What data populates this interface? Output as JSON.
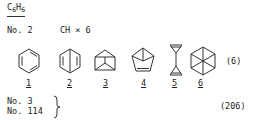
{
  "header": {
    "formula_base": "C",
    "formula_c_sub": "6",
    "formula_h": "H",
    "formula_h_sub": "6"
  },
  "entry1": {
    "number": "No. 2",
    "group": "CH × 6",
    "reference": "(6)",
    "structures": [
      {
        "label": "1",
        "name": "benzene",
        "icon": "benzene-icon"
      },
      {
        "label": "2",
        "name": "Dewar benzene",
        "icon": "dewar-benzene-icon"
      },
      {
        "label": "3",
        "name": "prismane",
        "icon": "prismane-icon"
      },
      {
        "label": "4",
        "name": "benzvalene",
        "icon": "benzvalene-icon"
      },
      {
        "label": "5",
        "name": "bicyclopropenyl",
        "icon": "bicyclopropenyl-icon"
      },
      {
        "label": "6",
        "name": "hexagonal structure",
        "icon": "hexagon-spoke-icon"
      }
    ]
  },
  "entry2": {
    "numbers": [
      "No. 3",
      "No. 114"
    ],
    "reference": "(206)"
  }
}
